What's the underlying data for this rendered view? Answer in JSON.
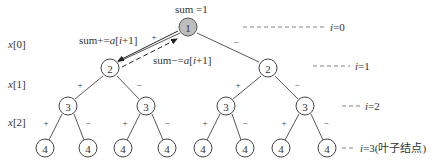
{
  "diagram": {
    "root_annotation": "sum =1",
    "forward_annotation": "sum+=a[i+1]",
    "backward_annotation": "sum−=a[i+1]",
    "row_labels": [
      {
        "label": "x[0]",
        "y": 44
      },
      {
        "label": "x[1]",
        "y": 84
      },
      {
        "label": "x[2]",
        "y": 122
      }
    ],
    "level_labels": [
      {
        "label": "i=0",
        "y": 27,
        "x1": 243,
        "x2": 325
      },
      {
        "label": "i=1",
        "y": 66,
        "x1": 313,
        "x2": 350
      },
      {
        "label": "i=2",
        "y": 106,
        "x1": 342,
        "x2": 361
      },
      {
        "label": "i=3(叶子结点)",
        "y": 148,
        "x1": 342,
        "x2": 356
      }
    ],
    "edge_sign_plus": "+",
    "edge_sign_minus": "−",
    "nodes": [
      {
        "id": "n1",
        "label": "1",
        "x": 188,
        "y": 27,
        "root": true
      },
      {
        "id": "n2a",
        "label": "2",
        "x": 110,
        "y": 68
      },
      {
        "id": "n2b",
        "label": "2",
        "x": 268,
        "y": 68
      },
      {
        "id": "n3a",
        "label": "3",
        "x": 68,
        "y": 106
      },
      {
        "id": "n3b",
        "label": "3",
        "x": 146,
        "y": 106
      },
      {
        "id": "n3c",
        "label": "3",
        "x": 226,
        "y": 106
      },
      {
        "id": "n3d",
        "label": "3",
        "x": 305,
        "y": 106
      },
      {
        "id": "n4a",
        "label": "4",
        "x": 45,
        "y": 148
      },
      {
        "id": "n4b",
        "label": "4",
        "x": 88,
        "y": 148
      },
      {
        "id": "n4c",
        "label": "4",
        "x": 123,
        "y": 148
      },
      {
        "id": "n4d",
        "label": "4",
        "x": 167,
        "y": 148
      },
      {
        "id": "n4e",
        "label": "4",
        "x": 203,
        "y": 148
      },
      {
        "id": "n4f",
        "label": "4",
        "x": 245,
        "y": 148
      },
      {
        "id": "n4g",
        "label": "4",
        "x": 281,
        "y": 148
      },
      {
        "id": "n4h",
        "label": "4",
        "x": 327,
        "y": 148
      }
    ]
  }
}
